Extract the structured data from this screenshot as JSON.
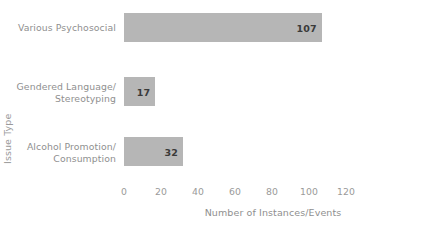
{
  "chart_data": {
    "type": "bar",
    "orientation": "horizontal",
    "title": "",
    "xlabel": "Number of Instances/Events",
    "ylabel": "Issue Type",
    "categories": [
      "Various Psychosocial",
      "Gendered Language/ Stereotyping",
      "Alcohol Promotion/ Consumption"
    ],
    "category_lines": [
      [
        "Various Psychosocial"
      ],
      [
        "Gendered Language/",
        "Stereotyping"
      ],
      [
        "Alcohol Promotion/",
        "Consumption"
      ]
    ],
    "values": [
      107,
      17,
      32
    ],
    "value_labels": [
      "107",
      "17",
      "32"
    ],
    "xlim": [
      0,
      120
    ],
    "xticks": [
      0,
      20,
      40,
      60,
      80,
      100,
      120
    ],
    "xtick_labels": [
      "0",
      "20",
      "40",
      "60",
      "80",
      "100",
      "120"
    ],
    "grid": false,
    "axis_lines": false,
    "legend": null,
    "bar_color": "#b6b6b6",
    "value_label_color": "#3a3a3a",
    "tick_label_color": "#9a9a9a",
    "axis_title_color": "#8f8f8f",
    "background_color": "#ffffff"
  }
}
